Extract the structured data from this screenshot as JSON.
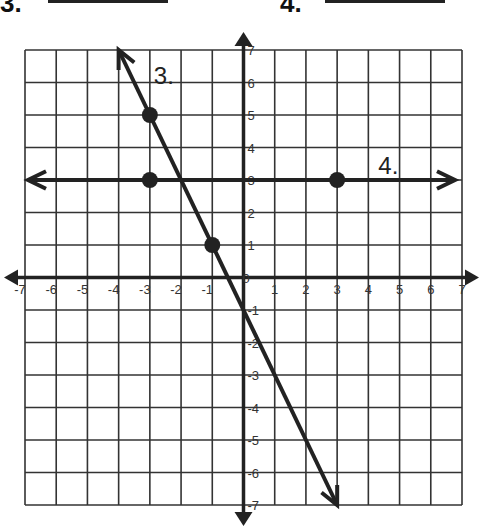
{
  "header": {
    "problem_3_label": "3.",
    "problem_4_label": "4."
  },
  "graph": {
    "x_ticks": [
      "-7",
      "-6",
      "-5",
      "-4",
      "-3",
      "-2",
      "-1",
      "0",
      "1",
      "2",
      "3",
      "4",
      "5",
      "6",
      "7"
    ],
    "y_ticks": [
      "7",
      "6",
      "5",
      "4",
      "3",
      "2",
      "1",
      "0",
      "-1",
      "-2",
      "-3",
      "-4",
      "-5",
      "-6",
      "-7"
    ],
    "lines": [
      {
        "label": "3.",
        "equation": "y = -2x - 1",
        "points": [
          [
            -3,
            5
          ],
          [
            -1,
            1
          ]
        ]
      },
      {
        "label": "4.",
        "equation": "y = 3",
        "points": [
          [
            -3,
            3
          ],
          [
            3,
            3
          ]
        ]
      }
    ]
  }
}
